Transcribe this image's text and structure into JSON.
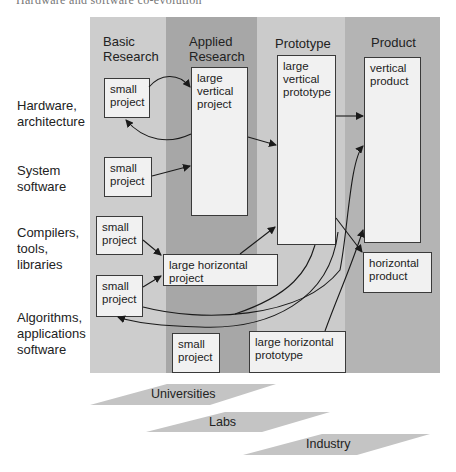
{
  "header_cut_text": "Hardware and software co-evolution",
  "columns": [
    {
      "id": "basic",
      "title": "Basic\nResearch",
      "color": "#cdcdcd"
    },
    {
      "id": "applied",
      "title": "Applied\nResearch",
      "color": "#a7a7a7"
    },
    {
      "id": "prototype",
      "title": "Prototype",
      "color": "#cbcbcb"
    },
    {
      "id": "product",
      "title": "Product",
      "color": "#b4b4b4"
    }
  ],
  "rows": [
    {
      "label": "Hardware,\narchitecture"
    },
    {
      "label": "System\nsoftware"
    },
    {
      "label": "Compilers,\ntools,\nlibraries"
    },
    {
      "label": "Algorithms,\napplications\nsoftware"
    }
  ],
  "boxes": {
    "small_hw": "small\nproject",
    "small_sys": "small\nproject",
    "small_comp": "small\nproject",
    "small_alg": "small\nproject",
    "small_applied": "small\nproject",
    "large_vertical_project": "large\nvertical\nproject",
    "large_horizontal_project": "large horizontal\nproject",
    "large_vertical_prototype": "large\nvertical\nprototype",
    "large_horizontal_prototype": "large horizontal\nprototype",
    "vertical_product": "vertical\nproduct",
    "horizontal_product": "horizontal\nproduct"
  },
  "banners": [
    {
      "label": "Universities",
      "color": "#c4c4c4"
    },
    {
      "label": "Labs",
      "color": "#c4c4c4"
    },
    {
      "label": "Industry",
      "color": "#c4c4c4"
    }
  ],
  "edge_color": "#1a1a1a"
}
